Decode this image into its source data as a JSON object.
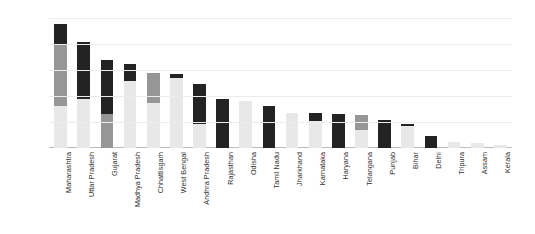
{
  "chart_data": {
    "type": "bar",
    "title": "",
    "subtitle": "",
    "xlabel": "",
    "ylabel": "Installed Capacity (GW)",
    "ylim": [
      0,
      25
    ],
    "yticks": [
      0,
      5,
      10,
      15,
      20,
      25
    ],
    "grid": true,
    "stacked": true,
    "legend": "none",
    "categories": [
      "Maharashtra",
      "Uttar Pradesh",
      "Gujarat",
      "Madhya Pradesh",
      "Chhattisgarh",
      "West Bengal",
      "Andhra Pradesh",
      "Rajasthan",
      "Odisha",
      "Tamil Nadu",
      "Jharkhand",
      "Karnataka",
      "Haryana",
      "Telangana",
      "Punjab",
      "Bihar",
      "Delhi",
      "Tripura",
      "Assam",
      "Kerala"
    ],
    "series": [
      {
        "name": "light-segment",
        "color": "#e8e8e8",
        "values": [
          8.0,
          9.5,
          0.0,
          12.9,
          8.7,
          13.4,
          4.7,
          0.0,
          9.0,
          0.0,
          6.7,
          5.2,
          0.0,
          3.4,
          0.0,
          4.3,
          0.0,
          1.2,
          1.0,
          0.5
        ]
      },
      {
        "name": "medium-segment",
        "color": "#969696",
        "values": [
          12.0,
          0.0,
          6.5,
          0.0,
          5.7,
          0.0,
          0.0,
          0.0,
          0.0,
          0.0,
          0.0,
          0.0,
          0.0,
          2.9,
          0.0,
          0.0,
          0.0,
          0.0,
          0.0,
          0.0
        ]
      },
      {
        "name": "dark-segment",
        "color": "#232323",
        "values": [
          3.9,
          10.9,
          10.4,
          3.3,
          0.0,
          0.8,
          7.6,
          9.4,
          0.0,
          8.1,
          0.0,
          1.5,
          6.5,
          0.0,
          5.4,
          0.3,
          2.3,
          0.0,
          0.0,
          0.0
        ]
      }
    ],
    "totals": [
      23.9,
      20.4,
      16.9,
      16.2,
      14.4,
      14.2,
      12.3,
      9.4,
      9.0,
      8.1,
      6.7,
      6.7,
      6.5,
      6.3,
      5.4,
      4.6,
      2.3,
      1.2,
      1.0,
      0.5
    ]
  },
  "axis": {
    "ytick_labels": [
      "0",
      "5",
      "10",
      "15",
      "20",
      "25"
    ]
  }
}
